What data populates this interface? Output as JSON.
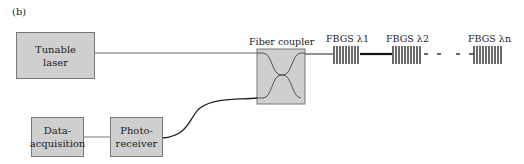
{
  "figure": {
    "panel_label": "(b)",
    "colors": {
      "box_fill": "#cfcfcf",
      "line": "#333333"
    },
    "components": {
      "tunable_laser": {
        "line1": "Tunable",
        "line2": "laser"
      },
      "fiber_coupler": {
        "label": "Fiber coupler"
      },
      "data_acquisition": {
        "line1": "Data-",
        "line2": "acquisition"
      },
      "photo_receiver": {
        "line1": "Photo-",
        "line2": "receiver"
      }
    },
    "gratings": [
      {
        "label": "FBGS λ1"
      },
      {
        "label": "FBGS λ2"
      },
      {
        "label": "FBGS λn"
      }
    ]
  }
}
